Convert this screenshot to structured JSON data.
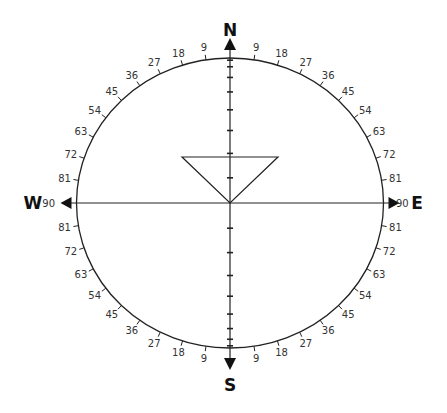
{
  "diagram": {
    "type": "compass-stereonet",
    "center": {
      "x": 230,
      "y": 203
    },
    "ellipse": {
      "rx": 153.5,
      "ry": 145
    },
    "stroke_color": "#222222",
    "label_color": "#333333",
    "cardinals": {
      "north": "N",
      "south": "S",
      "east": "E",
      "west": "W"
    },
    "edge_labels": {
      "east": "90",
      "west": "90"
    },
    "rim_ticks_deg": [
      9,
      18,
      27,
      36,
      45,
      54,
      63,
      72,
      81
    ],
    "rim_tick_labels": [
      "9",
      "18",
      "27",
      "36",
      "45",
      "54",
      "63",
      "72",
      "81"
    ],
    "vertical_axis_ticks_deg": [
      10,
      20,
      30,
      40,
      50,
      60,
      70,
      80
    ],
    "triangle": {
      "apex": {
        "x": 230,
        "y": 203
      },
      "top_left": {
        "x": 182,
        "y": 157
      },
      "top_right": {
        "x": 278,
        "y": 157
      }
    }
  }
}
